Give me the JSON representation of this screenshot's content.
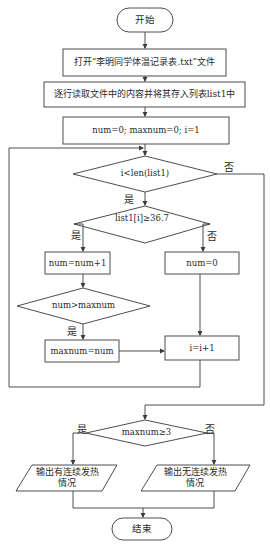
{
  "flowchart": {
    "start": "开始",
    "open_file": "打开“李明同学体温记录表.txt”文件",
    "read_lines": "逐行读取文件中的内容并将其存入列表list1中",
    "init": "num=0; maxnum=0; i=1",
    "cond_loop": "i<len(list1)",
    "cond_temp": "list1[i]≥36.7",
    "num_inc": "num=num+1",
    "num_reset": "num=0",
    "cond_max": "num>maxnum",
    "set_max": "maxnum=num",
    "i_inc": "i=i+1",
    "cond_final": "maxnum≥3",
    "output_yes_line1": "输出有连续发热",
    "output_yes_line2": "情况",
    "output_no_line1": "输出无连续发热",
    "output_no_line2": "情况",
    "end": "结束"
  },
  "labels": {
    "yes": "是",
    "no": "否"
  },
  "colors": {
    "line": "#3a3a3a",
    "background": "#ffffff"
  }
}
